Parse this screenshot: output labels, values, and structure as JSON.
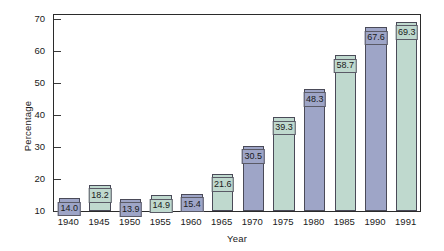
{
  "chart_data": {
    "type": "bar",
    "title": "",
    "xlabel": "Year",
    "ylabel": "Percentage",
    "categories": [
      "1940",
      "1945",
      "1950",
      "1955",
      "1960",
      "1965",
      "1970",
      "1975",
      "1980",
      "1985",
      "1990",
      "1991"
    ],
    "values": [
      14.0,
      18.2,
      13.9,
      14.9,
      15.4,
      21.6,
      30.5,
      39.3,
      48.3,
      58.7,
      67.6,
      69.3
    ],
    "data_labels": [
      "14.0",
      "18.2",
      "13.9",
      "14.9",
      "15.4",
      "21.6",
      "30.5",
      "39.3",
      "48.3",
      "58.7",
      "67.6",
      "69.3"
    ],
    "bar_colors": [
      "blue",
      "green",
      "blue",
      "green",
      "blue",
      "green",
      "blue",
      "green",
      "blue",
      "green",
      "blue",
      "green"
    ],
    "ylim": [
      10,
      72
    ],
    "yticks": [
      10,
      20,
      30,
      40,
      50,
      60,
      70
    ],
    "ytick_labels": [
      "10",
      "20",
      "30",
      "40",
      "50",
      "60",
      "70"
    ],
    "grid": false,
    "legend": "none",
    "colors": {
      "blue": "#9ea5c7",
      "green": "#bfd9ce",
      "bar_border": "#4a4a58",
      "frame": "#2b2b2b",
      "text": "#1a1a1a",
      "background": "#ffffff"
    }
  }
}
